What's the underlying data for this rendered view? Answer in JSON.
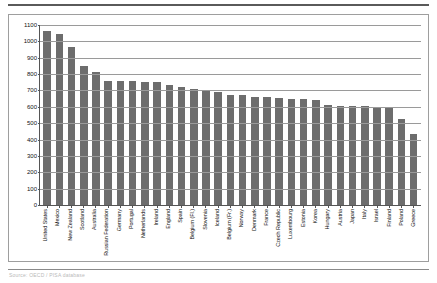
{
  "page": {
    "source_note": "Source: OECD / PISA database"
  },
  "chart_data": {
    "type": "bar",
    "title": "",
    "subtitle": "",
    "xlabel": "",
    "ylabel": "",
    "ylim": [
      0,
      1100
    ],
    "ytick_step": 100,
    "yticks": [
      0,
      100,
      200,
      300,
      400,
      500,
      600,
      700,
      800,
      900,
      1000,
      1100
    ],
    "grid": true,
    "legend": "none",
    "bar_color": "#6d6d6d",
    "categories": [
      "United States",
      "Mexico",
      "New Zealand",
      "Scotland",
      "Australia",
      "Russian Federation",
      "Germany",
      "Portugal",
      "Netherlands",
      "Ireland",
      "England",
      "Spain",
      "Belgium (Fl.)",
      "Slovenia",
      "Iceland",
      "Belgium (Fr.)",
      "Norway",
      "Denmark",
      "France",
      "Czech Republic",
      "Luxembourg",
      "Estonia",
      "Korea",
      "Hungary",
      "Austria",
      "Japan",
      "Italy",
      "Israel",
      "Finland",
      "Poland",
      "Greece"
    ],
    "values": [
      1065,
      1047,
      963,
      852,
      815,
      757,
      757,
      755,
      752,
      750,
      735,
      722,
      712,
      700,
      688,
      675,
      670,
      662,
      660,
      655,
      650,
      645,
      640,
      612,
      608,
      605,
      603,
      600,
      598,
      525,
      435
    ]
  }
}
